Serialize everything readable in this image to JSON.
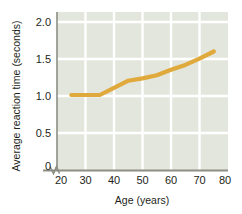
{
  "chart_data": {
    "type": "line",
    "title": "",
    "xlabel": "Age (years)",
    "ylabel": "Average reaction time (seconds)",
    "xlim": [
      20,
      80
    ],
    "ylim": [
      0,
      2.0
    ],
    "xticks": [
      20,
      30,
      40,
      50,
      60,
      70,
      80
    ],
    "xtick_labels": [
      "20",
      "30",
      "40",
      "50",
      "60",
      "70",
      "80"
    ],
    "yticks": [
      0,
      0.5,
      1.0,
      1.5,
      2.0
    ],
    "ytick_labels": [
      "0",
      "0.5",
      "1.0",
      "1.5",
      "2.0"
    ],
    "grid": true,
    "legend": "none",
    "axis_break": "x-axis break between 0 and 20",
    "series": [
      {
        "name": "Average reaction time",
        "color": "#e0a93c",
        "x": [
          25,
          30,
          35,
          40,
          45,
          50,
          55,
          60,
          65,
          70,
          75
        ],
        "values": [
          0.95,
          0.95,
          0.95,
          1.04,
          1.13,
          1.16,
          1.2,
          1.27,
          1.33,
          1.41,
          1.5
        ]
      }
    ]
  },
  "style": {
    "plot_background": "#e3e6dc",
    "gridline_color": "#ffffff",
    "axis_color": "#8d8f84",
    "text_color": "#231f20",
    "line_color": "#e0a93c"
  }
}
